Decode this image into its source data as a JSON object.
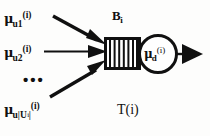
{
  "figure": {
    "caption": "T(i)",
    "buffer_label": "B",
    "buffer_label_sub": "i",
    "background_color": "#fdfdfc",
    "ink_color": "#101010"
  },
  "inputs": [
    {
      "name": "arrival-rate-1",
      "mu": "μ",
      "subscript": "u1",
      "superscript": "(i)",
      "arrow_style": "diagonal-down"
    },
    {
      "name": "arrival-rate-2",
      "mu": "μ",
      "subscript": "u2",
      "superscript": "(i)",
      "arrow_style": "horizontal"
    },
    {
      "name": "arrival-rate-n",
      "mu": "μ",
      "subscript_prefix": "u|U",
      "subscript_index": "i",
      "subscript_suffix": "|",
      "superscript": "(i)",
      "arrow_style": "diagonal-up"
    }
  ],
  "ellipsis": "•••",
  "server": {
    "name": "departure-rate",
    "mu": "μ",
    "subscript": "d",
    "superscript": "(i)",
    "shape": "circle"
  },
  "output": {
    "name": "departure-arrow",
    "label": ""
  },
  "buffer": {
    "slot_count": 7,
    "shape": "rectangle-with-slots"
  }
}
